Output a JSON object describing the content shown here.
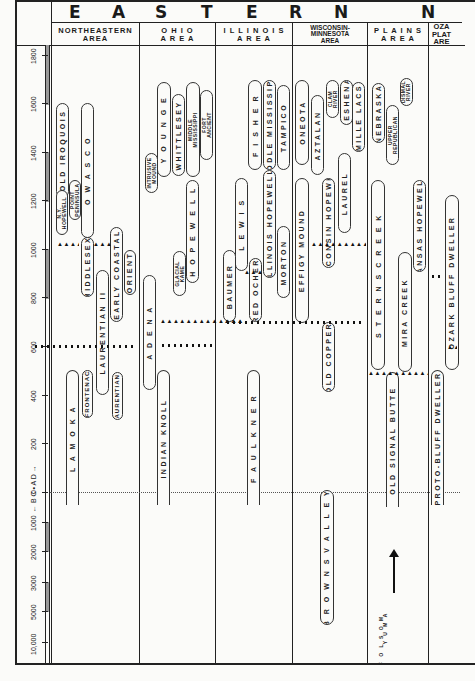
{
  "chart_data": {
    "type": "table",
    "title": "EASTERN",
    "axis": {
      "label": "← B.C. • A.D. →",
      "ticks": [
        "1800",
        "1600",
        "1400",
        "1200",
        "1000",
        "800",
        "600",
        "400",
        "200",
        "0",
        "1000",
        "2000",
        "3000",
        "5000",
        "10,000"
      ]
    },
    "areas": [
      {
        "name": "NORTHEASTERN AREA",
        "phases": [
          {
            "label": "OLD IROQUOIS",
            "start": 1300,
            "end": 1600
          },
          {
            "label": "N.Y. HOPEWELL",
            "start": 1100,
            "end": 1250
          },
          {
            "label": "POINT PENINSULA",
            "start": 1200,
            "end": 1300
          },
          {
            "label": "OWASCO",
            "start": 1250,
            "end": 1600
          },
          {
            "label": "MIDDLESEX",
            "start": 850,
            "end": 1050
          },
          {
            "label": "LAURENTIAN II",
            "start": 550,
            "end": 900
          },
          {
            "label": "EARLY COASTAL",
            "start": 750,
            "end": 1050
          },
          {
            "label": "ORIENT",
            "start": 850,
            "end": 1000
          },
          {
            "label": "LAMOKA",
            "start": -1000,
            "end": 500
          },
          {
            "label": "FRONTENAC",
            "start": 350,
            "end": 480
          },
          {
            "label": "LAURENTIAN I",
            "start": 300,
            "end": 450
          }
        ]
      },
      {
        "name": "OHIO AREA",
        "phases": [
          {
            "label": "YOUNGE",
            "start": 1400,
            "end": 1700
          },
          {
            "label": "WHITTLESEY",
            "start": 1350,
            "end": 1650
          },
          {
            "label": "MIDDLE MISSISSIPPI",
            "start": 1350,
            "end": 1700
          },
          {
            "label": "FORT ANCIENT",
            "start": 1350,
            "end": 1650
          },
          {
            "label": "INTRUSIVE MOUND",
            "start": 1250,
            "end": 1350
          },
          {
            "label": "HOPEWELL",
            "start": 850,
            "end": 1250
          },
          {
            "label": "GLACIAL KAME",
            "start": 800,
            "end": 950
          },
          {
            "label": "ADENA",
            "start": 500,
            "end": 800
          },
          {
            "label": "INDIAN KNOLL",
            "start": -100,
            "end": 450
          }
        ]
      },
      {
        "name": "ILLINOIS AREA",
        "phases": [
          {
            "label": "FISHER",
            "start": 1300,
            "end": 1650
          },
          {
            "label": "MIDDLE MISSISSIPPI",
            "start": 1300,
            "end": 1650
          },
          {
            "label": "TAMPICO",
            "start": 1350,
            "end": 1650
          },
          {
            "label": "LEWIS",
            "start": 900,
            "end": 1200
          },
          {
            "label": "ILLINOIS HOPEWELL",
            "start": 900,
            "end": 1300
          },
          {
            "label": "MORTON",
            "start": 800,
            "end": 1050
          },
          {
            "label": "BAUMER",
            "start": 700,
            "end": 950
          },
          {
            "label": "RED OCHER",
            "start": 700,
            "end": 900
          },
          {
            "label": "FAULKNER",
            "start": -100,
            "end": 450
          }
        ]
      },
      {
        "name": "WISCONSIN-MINNESOTA AREA",
        "phases": [
          {
            "label": "ONEOTA",
            "start": 1300,
            "end": 1650
          },
          {
            "label": "AZTALAN",
            "start": 1200,
            "end": 1500
          },
          {
            "label": "CLAM RIVER",
            "start": 1500,
            "end": 1650
          },
          {
            "label": "KESHENA",
            "start": 1450,
            "end": 1650
          },
          {
            "label": "MILLE LACS",
            "start": 1350,
            "end": 1650
          },
          {
            "label": "EFFIGY MOUND",
            "start": 700,
            "end": 1300
          },
          {
            "label": "WISCONSIN HOPEWELL",
            "start": 900,
            "end": 1300
          },
          {
            "label": "LAUREL",
            "start": 1050,
            "end": 1300
          },
          {
            "label": "OLD COPPER",
            "start": 350,
            "end": 700
          },
          {
            "label": "BROWNS VALLEY",
            "start": -6000,
            "end": 0
          }
        ]
      },
      {
        "name": "PLAINS AREA",
        "phases": [
          {
            "label": "NEBRASKA",
            "start": 1350,
            "end": 1600
          },
          {
            "label": "UPPER REPUBLICAN",
            "start": 1250,
            "end": 1500
          },
          {
            "label": "DISMAL RIVER",
            "start": 1550,
            "end": 1650
          },
          {
            "label": "STERNS CREEK",
            "start": 500,
            "end": 1200
          },
          {
            "label": "MIRA CREEK",
            "start": 500,
            "end": 950
          },
          {
            "label": "KANSAS HOPEWELL",
            "start": 900,
            "end": 1200
          },
          {
            "label": "OLD SIGNAL BUTTE",
            "start": -100,
            "end": 500
          },
          {
            "label": "YUMA",
            "start": -8000,
            "end": -8000
          },
          {
            "label": "FOLSOM",
            "start": -10000,
            "end": -10000
          }
        ]
      },
      {
        "name": "OZARK PLATEAU AREA",
        "phases": [
          {
            "label": "OZARK BLUFF DWELLER",
            "start": 600,
            "end": 1100
          },
          {
            "label": "PROTO-BLUFF DWELLER",
            "start": -100,
            "end": 450
          }
        ]
      }
    ],
    "horizon_lines": [
      {
        "style": "triangles",
        "year": 900,
        "areas": [
          "NORTHEASTERN AREA",
          "ILLINOIS AREA",
          "WISCONSIN-MINNESOTA AREA"
        ]
      },
      {
        "style": "triangles",
        "year": 700,
        "areas": [
          "OHIO AREA",
          "ILLINOIS AREA"
        ]
      },
      {
        "style": "dots",
        "year": 600,
        "areas": [
          "NORTHEASTERN AREA",
          "OHIO AREA"
        ]
      },
      {
        "style": "dots",
        "year": 700,
        "areas": [
          "ILLINOIS AREA",
          "WISCONSIN-MINNESOTA AREA"
        ]
      },
      {
        "style": "triangles",
        "year": 500,
        "areas": [
          "PLAINS AREA"
        ]
      }
    ]
  },
  "header": {
    "title_letters": [
      "E",
      "A",
      "S",
      "T",
      "E",
      "R",
      "N",
      "N"
    ],
    "areas": [
      "NORTHEASTERN\nAREA",
      "O H I O\nA R E A",
      "I L L I N O I S\nA R E A",
      "WISCONSIN-\nMINNESOTA\nAREA",
      "P L A I N S\nA R E A",
      "OZA\nPLAT\nARE"
    ]
  },
  "axis": {
    "bcad_label": "← B C • A D →",
    "ticks": [
      {
        "label": "1800",
        "y": 55
      },
      {
        "label": "1600",
        "y": 103
      },
      {
        "label": "1400",
        "y": 152
      },
      {
        "label": "1200",
        "y": 200
      },
      {
        "label": "1000",
        "y": 249
      },
      {
        "label": "800",
        "y": 297
      },
      {
        "label": "600",
        "y": 346
      },
      {
        "label": "400",
        "y": 395
      },
      {
        "label": "200",
        "y": 443
      },
      {
        "label": "0",
        "y": 492
      },
      {
        "label": "1000",
        "y": 522
      },
      {
        "label": "2000",
        "y": 551
      },
      {
        "label": "3000",
        "y": 582
      },
      {
        "label": "5000",
        "y": 611
      },
      {
        "label": "10,000",
        "y": 642
      }
    ]
  },
  "phases": [
    {
      "label": "OLD IROQUOIS",
      "x": 56,
      "y": 103,
      "w": 13,
      "h": 95,
      "size": "normal"
    },
    {
      "label": "N.Y.\nHOPEWELL",
      "x": 56,
      "y": 190,
      "w": 12,
      "h": 45,
      "size": "small"
    },
    {
      "label": "POINT\nPENINSULA",
      "x": 69,
      "y": 180,
      "w": 12,
      "h": 40,
      "size": "small"
    },
    {
      "label": "O W A S C O",
      "x": 81,
      "y": 103,
      "w": 13,
      "h": 135,
      "size": "normal"
    },
    {
      "label": "MIDDLESEX",
      "x": 81,
      "y": 237,
      "w": 13,
      "h": 60,
      "size": "normal"
    },
    {
      "label": "LAURENTIAN II",
      "x": 96,
      "y": 270,
      "w": 13,
      "h": 125,
      "size": "normal"
    },
    {
      "label": "EARLY COASTAL",
      "x": 110,
      "y": 227,
      "w": 13,
      "h": 95,
      "size": "normal"
    },
    {
      "label": "ORIENT",
      "x": 124,
      "y": 250,
      "w": 12,
      "h": 45,
      "size": "normal"
    },
    {
      "label": "L A M O K A",
      "x": 66,
      "y": 370,
      "w": 13,
      "h": 135,
      "size": "normal",
      "open": true
    },
    {
      "label": "FRONTENAC",
      "x": 82,
      "y": 370,
      "w": 11,
      "h": 48,
      "size": "small1"
    },
    {
      "label": "LAURENTIAN I",
      "x": 112,
      "y": 372,
      "w": 11,
      "h": 48,
      "size": "small1"
    },
    {
      "label": "Y O U N G E",
      "x": 157,
      "y": 82,
      "w": 14,
      "h": 95,
      "size": "normal"
    },
    {
      "label": "WHITTLESEY",
      "x": 172,
      "y": 94,
      "w": 13,
      "h": 82,
      "size": "normal"
    },
    {
      "label": "MIDDLE\nMISSISSIPPI",
      "x": 186,
      "y": 82,
      "w": 14,
      "h": 95,
      "size": "small"
    },
    {
      "label": "FORT\nANCIENT",
      "x": 200,
      "y": 90,
      "w": 13,
      "h": 70,
      "size": "small"
    },
    {
      "label": "INTRUSIVE\nMOUND",
      "x": 145,
      "y": 153,
      "w": 13,
      "h": 40,
      "size": "small"
    },
    {
      "label": "H O P E W E L L",
      "x": 186,
      "y": 180,
      "w": 13,
      "h": 103,
      "size": "normal"
    },
    {
      "label": "GLACIAL\nKAME",
      "x": 173,
      "y": 251,
      "w": 13,
      "h": 45,
      "size": "small"
    },
    {
      "label": "A D E N A",
      "x": 143,
      "y": 275,
      "w": 13,
      "h": 115,
      "size": "normal"
    },
    {
      "label": "INDIAN  KNOLL",
      "x": 157,
      "y": 370,
      "w": 13,
      "h": 135,
      "size": "normal",
      "open": true
    },
    {
      "label": "F I S H E R",
      "x": 248,
      "y": 80,
      "w": 14,
      "h": 90,
      "size": "normal"
    },
    {
      "label": "MIDDLE MISSISSIPPI",
      "x": 263,
      "y": 80,
      "w": 13,
      "h": 90,
      "size": "normal"
    },
    {
      "label": "TAMPICO",
      "x": 277,
      "y": 85,
      "w": 13,
      "h": 85,
      "size": "normal"
    },
    {
      "label": "L E W I S",
      "x": 235,
      "y": 178,
      "w": 13,
      "h": 93,
      "size": "normal"
    },
    {
      "label": "ILLINOIS HOPEWELL",
      "x": 263,
      "y": 170,
      "w": 13,
      "h": 108,
      "size": "normal"
    },
    {
      "label": "MORTON",
      "x": 277,
      "y": 226,
      "w": 13,
      "h": 72,
      "size": "normal"
    },
    {
      "label": "BAUMER",
      "x": 223,
      "y": 250,
      "w": 13,
      "h": 72,
      "size": "normal"
    },
    {
      "label": "RED OCHER",
      "x": 249,
      "y": 258,
      "w": 13,
      "h": 64,
      "size": "normal"
    },
    {
      "label": "F A U L K N E R",
      "x": 247,
      "y": 370,
      "w": 13,
      "h": 135,
      "size": "normal",
      "open": true
    },
    {
      "label": "ONEOTA",
      "x": 295,
      "y": 80,
      "w": 14,
      "h": 85,
      "size": "normal"
    },
    {
      "label": "AZTALAN",
      "x": 311,
      "y": 95,
      "w": 13,
      "h": 80,
      "size": "normal"
    },
    {
      "label": "CLAM\nRIVER",
      "x": 326,
      "y": 80,
      "w": 13,
      "h": 38,
      "size": "small"
    },
    {
      "label": "KESHENA",
      "x": 340,
      "y": 80,
      "w": 13,
      "h": 45,
      "size": "normal"
    },
    {
      "label": "MILLE LACS",
      "x": 352,
      "y": 82,
      "w": 13,
      "h": 70,
      "size": "normal"
    },
    {
      "label": "EFFIGY  MOUND",
      "x": 295,
      "y": 178,
      "w": 14,
      "h": 145,
      "size": "normal"
    },
    {
      "label": "WISCONSIN HOPEWELL",
      "x": 322,
      "y": 178,
      "w": 13,
      "h": 90,
      "size": "normal"
    },
    {
      "label": "LAUREL",
      "x": 338,
      "y": 153,
      "w": 13,
      "h": 80,
      "size": "normal"
    },
    {
      "label": "OLD COPPER",
      "x": 322,
      "y": 322,
      "w": 13,
      "h": 70,
      "size": "normal"
    },
    {
      "label": "B R O W N S     V A L L E Y",
      "x": 320,
      "y": 490,
      "w": 14,
      "h": 135,
      "size": "normal"
    },
    {
      "label": "NEBRASKA",
      "x": 372,
      "y": 83,
      "w": 13,
      "h": 60,
      "size": "normal"
    },
    {
      "label": "UPPER\nREPUBLICAN",
      "x": 386,
      "y": 105,
      "w": 13,
      "h": 60,
      "size": "small"
    },
    {
      "label": "DISMAL\nRIVER",
      "x": 400,
      "y": 78,
      "w": 13,
      "h": 28,
      "size": "small"
    },
    {
      "label": "S T E R N S    C R E E K",
      "x": 371,
      "y": 180,
      "w": 14,
      "h": 190,
      "size": "normal"
    },
    {
      "label": "MIRA  CREEK",
      "x": 398,
      "y": 252,
      "w": 14,
      "h": 120,
      "size": "normal"
    },
    {
      "label": "KANSAS  HOPEWELL",
      "x": 413,
      "y": 180,
      "w": 13,
      "h": 92,
      "size": "normal"
    },
    {
      "label": "OLD  SIGNAL  BUTTE",
      "x": 386,
      "y": 372,
      "w": 13,
      "h": 135,
      "size": "normal",
      "open": true
    },
    {
      "label": "OZARK  BLUFF  DWELLER",
      "x": 445,
      "y": 195,
      "w": 14,
      "h": 175,
      "size": "normal"
    },
    {
      "label": "PROTO-BLUFF DWELLER",
      "x": 431,
      "y": 370,
      "w": 13,
      "h": 135,
      "size": "normal",
      "open": true
    }
  ],
  "horizons": [
    {
      "type": "tri",
      "x": 57,
      "y": 242,
      "w": 22
    },
    {
      "type": "tri",
      "x": 93,
      "y": 242,
      "w": 18
    },
    {
      "type": "tri",
      "x": 244,
      "y": 270,
      "w": 20
    },
    {
      "type": "tri",
      "x": 311,
      "y": 242,
      "w": 55
    },
    {
      "type": "tri",
      "x": 160,
      "y": 319,
      "w": 85
    },
    {
      "type": "tri",
      "x": 224,
      "y": 319,
      "w": 20
    },
    {
      "type": "tri",
      "x": 368,
      "y": 371,
      "w": 60
    },
    {
      "type": "tri",
      "x": 447,
      "y": 345,
      "w": 10
    },
    {
      "type": "dots",
      "x": 33,
      "y": 345,
      "w": 100
    },
    {
      "type": "dots",
      "x": 160,
      "y": 344,
      "w": 55
    },
    {
      "type": "dots",
      "x": 225,
      "y": 321,
      "w": 140
    },
    {
      "type": "dots",
      "x": 430,
      "y": 275,
      "w": 10
    }
  ],
  "plains_bottom": {
    "yuma": "Y U M A",
    "folsom": "F O L S O M"
  }
}
